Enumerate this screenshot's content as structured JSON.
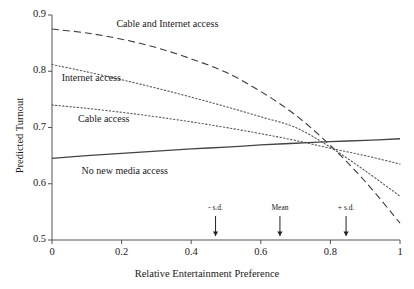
{
  "chart_data": {
    "type": "line",
    "title": "",
    "xlabel": "Relative Entertainment Preference",
    "ylabel": "Predicted Turnout",
    "xlim": [
      0,
      1
    ],
    "ylim": [
      0.5,
      0.9
    ],
    "xticks": [
      "0",
      "0.2",
      "0.4",
      "0.6",
      "0.8",
      "1"
    ],
    "xtick_values": [
      0,
      0.2,
      0.4,
      0.6,
      0.8,
      1
    ],
    "yticks": [
      "0.5",
      "0.6",
      "0.7",
      "0.8",
      "0.9"
    ],
    "ytick_values": [
      0.5,
      0.6,
      0.7,
      0.8,
      0.9
    ],
    "grid": false,
    "legend_position": "inline-annotations",
    "x": [
      0,
      0.1,
      0.2,
      0.3,
      0.4,
      0.5,
      0.6,
      0.7,
      0.8,
      0.9,
      1
    ],
    "series": [
      {
        "name": "Cable and Internet access",
        "style": "long-dash",
        "color": "#3d3d3d",
        "values": [
          0.875,
          0.868,
          0.857,
          0.842,
          0.822,
          0.798,
          0.764,
          0.722,
          0.668,
          0.604,
          0.53
        ]
      },
      {
        "name": "Internet access",
        "style": "dotted",
        "color": "#5a5a5a",
        "values": [
          0.812,
          0.799,
          0.785,
          0.77,
          0.754,
          0.737,
          0.719,
          0.7,
          0.665,
          0.623,
          0.578
        ]
      },
      {
        "name": "Cable access",
        "style": "dotted",
        "color": "#5a5a5a",
        "values": [
          0.74,
          0.734,
          0.727,
          0.719,
          0.71,
          0.7,
          0.689,
          0.677,
          0.663,
          0.65,
          0.635
        ]
      },
      {
        "name": "No new media access",
        "style": "solid",
        "color": "#444444",
        "values": [
          0.645,
          0.65,
          0.654,
          0.658,
          0.662,
          0.665,
          0.669,
          0.672,
          0.675,
          0.677,
          0.68
        ]
      }
    ],
    "series_labels": [
      {
        "text": "Cable and Internet access",
        "x": 0.185,
        "y": 0.884
      },
      {
        "text": "Internet access",
        "x": 0.028,
        "y": 0.788
      },
      {
        "text": "Cable access",
        "x": 0.075,
        "y": 0.716
      },
      {
        "text": "No new media access",
        "x": 0.085,
        "y": 0.622
      }
    ],
    "annotations": [
      {
        "label": "- s.d.",
        "x": 0.47,
        "marker": "down-arrow"
      },
      {
        "label": "Mean",
        "x": 0.655,
        "marker": "down-arrow"
      },
      {
        "label": "+ s.d.",
        "x": 0.845,
        "marker": "down-arrow"
      }
    ],
    "crossing_point": {
      "x": 0.69,
      "y": 0.672
    }
  },
  "colors": {
    "axis": "#555555",
    "text": "#1a1a1a",
    "background": "#ffffff"
  }
}
